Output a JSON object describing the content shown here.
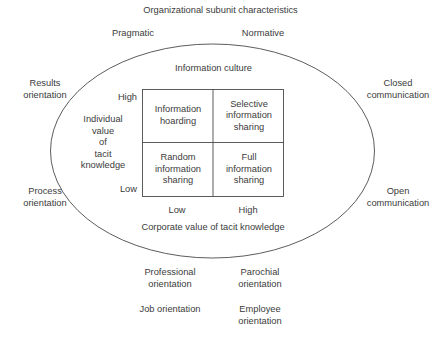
{
  "figure": {
    "title": "Organizational subunit characteristics",
    "inner_title": "Information culture"
  },
  "outer_labels": {
    "top_left": "Pragmatic",
    "top_right": "Normative",
    "left_upper": "Results\norientation",
    "left_lower": "Process\norientation",
    "right_upper": "Closed\ncommunication",
    "right_lower": "Open\ncommunication",
    "bottom_left_1": "Professional\norientation",
    "bottom_right_1": "Parochial\norientation",
    "bottom_left_2": "Job orientation",
    "bottom_right_2": "Employee\norientation"
  },
  "axes": {
    "y_title": "Individual\nvalue\nof\ntacit\nknowledge",
    "y_high": "High",
    "y_low": "Low",
    "x_low": "Low",
    "x_high": "High",
    "x_title": "Corporate value of tacit knowledge"
  },
  "matrix": {
    "cells": [
      {
        "id": "top-left",
        "label": "Information\nhoarding"
      },
      {
        "id": "top-right",
        "label": "Selective\ninformation\nsharing"
      },
      {
        "id": "bottom-left",
        "label": "Random\ninformation\nsharing"
      },
      {
        "id": "bottom-right",
        "label": "Full\ninformation\nsharing"
      }
    ]
  },
  "style": {
    "stroke": "#4a4a4a",
    "text": "#3b3b3b",
    "background": "#ffffff"
  }
}
